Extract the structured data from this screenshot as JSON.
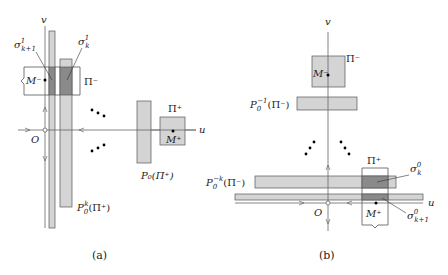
{
  "colors": {
    "bar_fill": "#d4d4d4",
    "overlap_fill": "#8a8a8a",
    "box_fill": "#d4d4d4",
    "stroke": "#555555",
    "axis": "#666666"
  },
  "panel_a": {
    "caption": "(a)",
    "axis_u": "u",
    "axis_v": "v",
    "origin": "O",
    "sigma_k1_base": "σ",
    "sigma_k1_sup": "1",
    "sigma_k1_sub": "k+1",
    "sigma_k_base": "σ",
    "sigma_k_sup": "1",
    "sigma_k_sub": "k",
    "pi_minus": "Π⁻",
    "m_minus": "M⁻",
    "pi_plus": "Π⁺",
    "m_plus": "M⁺",
    "p0_pi_plus": "P₀(Π⁺)",
    "p0k_base": "P",
    "p0k_sub": "0",
    "p0k_sup": "k",
    "p0k_arg": "(Π⁺)"
  },
  "panel_b": {
    "caption": "(b)",
    "axis_u": "u",
    "axis_v": "v",
    "origin": "O",
    "pi_minus": "Π⁻",
    "m_minus": "M⁻",
    "pi_plus": "Π⁺",
    "m_plus": "M⁺",
    "p0inv_base": "P",
    "p0inv_sub": "0",
    "p0inv_sup": "−1",
    "p0inv_arg": "(Π⁻)",
    "p0negk_base": "P",
    "p0negk_sub": "0",
    "p0negk_sup": "−k",
    "p0negk_arg": "(Π⁻)",
    "sigma_k_base": "σ",
    "sigma_k_sup": "0",
    "sigma_k_sub": "k",
    "sigma_k1_base": "σ",
    "sigma_k1_sup": "0",
    "sigma_k1_sub": "k+1"
  }
}
